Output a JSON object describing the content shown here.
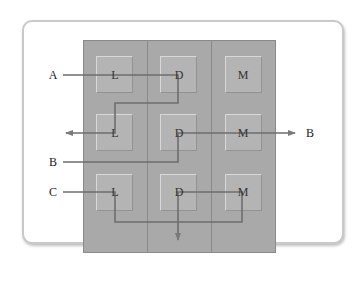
{
  "diagram": {
    "type": "layout-flow",
    "columns": [
      {
        "id": "col-1",
        "cells": [
          "L",
          "L",
          "L"
        ]
      },
      {
        "id": "col-2",
        "cells": [
          "D",
          "D",
          "D"
        ]
      },
      {
        "id": "col-3",
        "cells": [
          "M",
          "M",
          "M"
        ]
      }
    ],
    "grid": [
      [
        "L",
        "D",
        "M"
      ],
      [
        "L",
        "D",
        "M"
      ],
      [
        "L",
        "D",
        "M"
      ]
    ],
    "external_labels": {
      "a": "A",
      "b_left": "B",
      "b_right": "B",
      "c": "C"
    },
    "flows": [
      {
        "id": "flow-A",
        "label": "A",
        "path": [
          "A",
          "L(1,1)",
          "D(1,2)",
          "L(2,1)",
          "exit-left"
        ]
      },
      {
        "id": "flow-B",
        "label": "B",
        "path": [
          "B",
          "D(2,2)",
          "M(2,3)",
          "exit-right B"
        ]
      },
      {
        "id": "flow-C",
        "label": "C",
        "path": [
          "C",
          "L(3,1)",
          "M(3,3)",
          "D(3,2)",
          "exit-bottom"
        ]
      }
    ],
    "colors": {
      "column_fill": "#a9a9a9",
      "cell_fill": "#b4b4b4",
      "line": "#6e6e6e",
      "frame_border": "#c9c9c9"
    }
  }
}
